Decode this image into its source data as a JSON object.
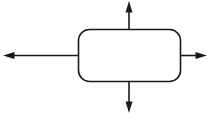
{
  "diagram": {
    "canvas": {
      "width": 214,
      "height": 121,
      "background_color": "#ffffff"
    },
    "style": {
      "stroke_color": "#1a1a1a",
      "stroke_width": 1.6,
      "fill_color": "#ffffff",
      "arrowhead_length": 11,
      "arrowhead_width": 7
    },
    "node": {
      "shape": "rounded-rectangle",
      "label": "",
      "x": 78.5,
      "y": 29.5,
      "width": 102,
      "height": 52,
      "corner_radius": 11
    },
    "arrows": [
      {
        "name": "up",
        "direction": "up",
        "label": "",
        "from": {
          "x": 129,
          "y": 29.5
        },
        "to": {
          "x": 129,
          "y": 1
        }
      },
      {
        "name": "down",
        "direction": "down",
        "label": "",
        "from": {
          "x": 129,
          "y": 81.5
        },
        "to": {
          "x": 129,
          "y": 113
        }
      },
      {
        "name": "left",
        "direction": "left",
        "label": "",
        "from": {
          "x": 78.5,
          "y": 55.5
        },
        "to": {
          "x": 3,
          "y": 55.5
        }
      },
      {
        "name": "right",
        "direction": "right",
        "label": "",
        "from": {
          "x": 180.5,
          "y": 55.5
        },
        "to": {
          "x": 207,
          "y": 55.5
        }
      }
    ]
  }
}
